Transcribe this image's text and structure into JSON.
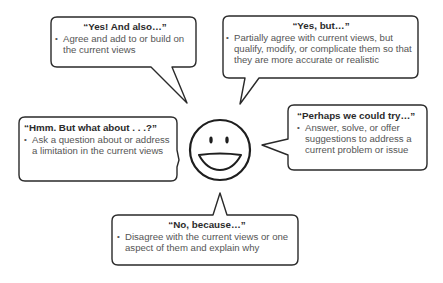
{
  "diagram": {
    "center": {
      "icon": "smiley-face-icon"
    },
    "colors": {
      "outline": "#2a2a2a",
      "title_text": "#2b2b2b",
      "body_text": "#555555",
      "background": "#ffffff"
    },
    "bubbles": [
      {
        "id": "yes-and-also",
        "title": "“Yes! And also…”",
        "bullet": "•",
        "text": "Agree and add to or build on the current views"
      },
      {
        "id": "yes-but",
        "title": "“Yes, but…”",
        "bullet": "•",
        "text": "Partially agree with current views, but qualify, modify, or complicate them so that they are more accurate or realistic"
      },
      {
        "id": "hmm-but-what-about",
        "title": "“Hmm. But what about . . .?”",
        "bullet": "•",
        "text": "Ask a question about or address a limitation in the current views"
      },
      {
        "id": "perhaps-we-could-try",
        "title": "“Perhaps we could try…”",
        "bullet": "•",
        "text": "Answer, solve, or offer suggestions to address a current problem or issue"
      },
      {
        "id": "no-because",
        "title": "“No, because…”",
        "bullet": "•",
        "text": "Disagree with the current views or one aspect of them and explain why"
      }
    ]
  }
}
